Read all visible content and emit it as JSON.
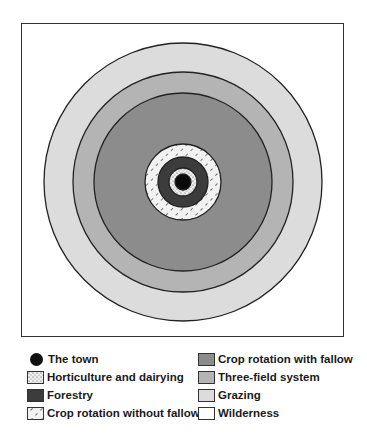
{
  "diagram": {
    "center": {
      "x": 183,
      "y": 182
    },
    "rings": [
      {
        "name": "Wilderness",
        "radius": null,
        "fill": "#ffffff"
      },
      {
        "name": "Grazing",
        "radius": 139,
        "fill": "#dcdcdc"
      },
      {
        "name": "Three-field system",
        "radius": 110,
        "fill": "#b4b4b4"
      },
      {
        "name": "Crop rotation with fallow",
        "radius": 89,
        "fill": "#8c8c8c"
      },
      {
        "name": "Crop rotation without fallow",
        "radius": 38,
        "fill": "#f2f2f2",
        "pattern": "hatch"
      },
      {
        "name": "Forestry",
        "radius": 25,
        "fill": "#3c3c3c"
      },
      {
        "name": "Horticulture and dairying",
        "radius": 14,
        "fill": "#eeeeee",
        "pattern": "dots"
      },
      {
        "name": "The town",
        "radius": 8,
        "fill": "#0a0a0a"
      }
    ]
  },
  "legend": {
    "left": [
      {
        "label": "The town",
        "type": "dot"
      },
      {
        "label": "Horticulture and dairying",
        "type": "dots",
        "color": "#eeeeee"
      },
      {
        "label": "Forestry",
        "type": "solid",
        "color": "#3c3c3c"
      },
      {
        "label": "Crop rotation without fallow",
        "type": "hatch",
        "color": "#f2f2f2"
      }
    ],
    "right": [
      {
        "label": "Crop rotation with fallow",
        "type": "solid",
        "color": "#8c8c8c"
      },
      {
        "label": "Three-field system",
        "type": "solid",
        "color": "#b4b4b4"
      },
      {
        "label": "Grazing",
        "type": "solid",
        "color": "#dcdcdc"
      },
      {
        "label": "Wilderness",
        "type": "solid",
        "color": "#ffffff"
      }
    ]
  }
}
